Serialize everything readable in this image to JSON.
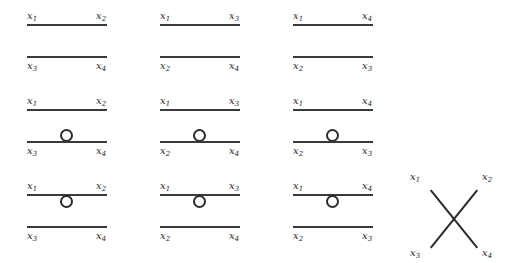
{
  "figure": {
    "background_color": "#ffffff",
    "line_color": "#3a3a3a",
    "label_color": "#2b2b2b",
    "variable_base": "x"
  },
  "grid": {
    "rows": 3,
    "columns": 3,
    "panels": [
      {
        "id": "r1c1",
        "row": 1,
        "column": 1,
        "loop": "none",
        "top_left": "x",
        "top_left_sub": "1",
        "top_right": "x",
        "top_right_sub": "2",
        "bottom_left": "x",
        "bottom_left_sub": "3",
        "bottom_right": "x",
        "bottom_right_sub": "4"
      },
      {
        "id": "r1c2",
        "row": 1,
        "column": 2,
        "loop": "none",
        "top_left": "x",
        "top_left_sub": "1",
        "top_right": "x",
        "top_right_sub": "3",
        "bottom_left": "x",
        "bottom_left_sub": "2",
        "bottom_right": "x",
        "bottom_right_sub": "4"
      },
      {
        "id": "r1c3",
        "row": 1,
        "column": 3,
        "loop": "none",
        "top_left": "x",
        "top_left_sub": "1",
        "top_right": "x",
        "top_right_sub": "4",
        "bottom_left": "x",
        "bottom_left_sub": "2",
        "bottom_right": "x",
        "bottom_right_sub": "3"
      },
      {
        "id": "r2c1",
        "row": 2,
        "column": 1,
        "loop": "on-lower-line",
        "top_left": "x",
        "top_left_sub": "1",
        "top_right": "x",
        "top_right_sub": "2",
        "bottom_left": "x",
        "bottom_left_sub": "3",
        "bottom_right": "x",
        "bottom_right_sub": "4"
      },
      {
        "id": "r2c2",
        "row": 2,
        "column": 2,
        "loop": "on-lower-line",
        "top_left": "x",
        "top_left_sub": "1",
        "top_right": "x",
        "top_right_sub": "3",
        "bottom_left": "x",
        "bottom_left_sub": "2",
        "bottom_right": "x",
        "bottom_right_sub": "4"
      },
      {
        "id": "r2c3",
        "row": 2,
        "column": 3,
        "loop": "on-lower-line",
        "top_left": "x",
        "top_left_sub": "1",
        "top_right": "x",
        "top_right_sub": "4",
        "bottom_left": "x",
        "bottom_left_sub": "2",
        "bottom_right": "x",
        "bottom_right_sub": "3"
      },
      {
        "id": "r3c1",
        "row": 3,
        "column": 1,
        "loop": "under-upper-line",
        "top_left": "x",
        "top_left_sub": "1",
        "top_right": "x",
        "top_right_sub": "2",
        "bottom_left": "x",
        "bottom_left_sub": "3",
        "bottom_right": "x",
        "bottom_right_sub": "4"
      },
      {
        "id": "r3c2",
        "row": 3,
        "column": 2,
        "loop": "under-upper-line",
        "top_left": "x",
        "top_left_sub": "1",
        "top_right": "x",
        "top_right_sub": "3",
        "bottom_left": "x",
        "bottom_left_sub": "2",
        "bottom_right": "x",
        "bottom_right_sub": "4"
      },
      {
        "id": "r3c3",
        "row": 3,
        "column": 3,
        "loop": "under-upper-line",
        "top_left": "x",
        "top_left_sub": "1",
        "top_right": "x",
        "top_right_sub": "4",
        "bottom_left": "x",
        "bottom_left_sub": "2",
        "bottom_right": "x",
        "bottom_right_sub": "3"
      }
    ]
  },
  "crossing_diagram": {
    "id": "x-crossing",
    "top_left": "x",
    "top_left_sub": "1",
    "top_right": "x",
    "top_right_sub": "2",
    "bottom_left": "x",
    "bottom_left_sub": "3",
    "bottom_right": "x",
    "bottom_right_sub": "4"
  }
}
